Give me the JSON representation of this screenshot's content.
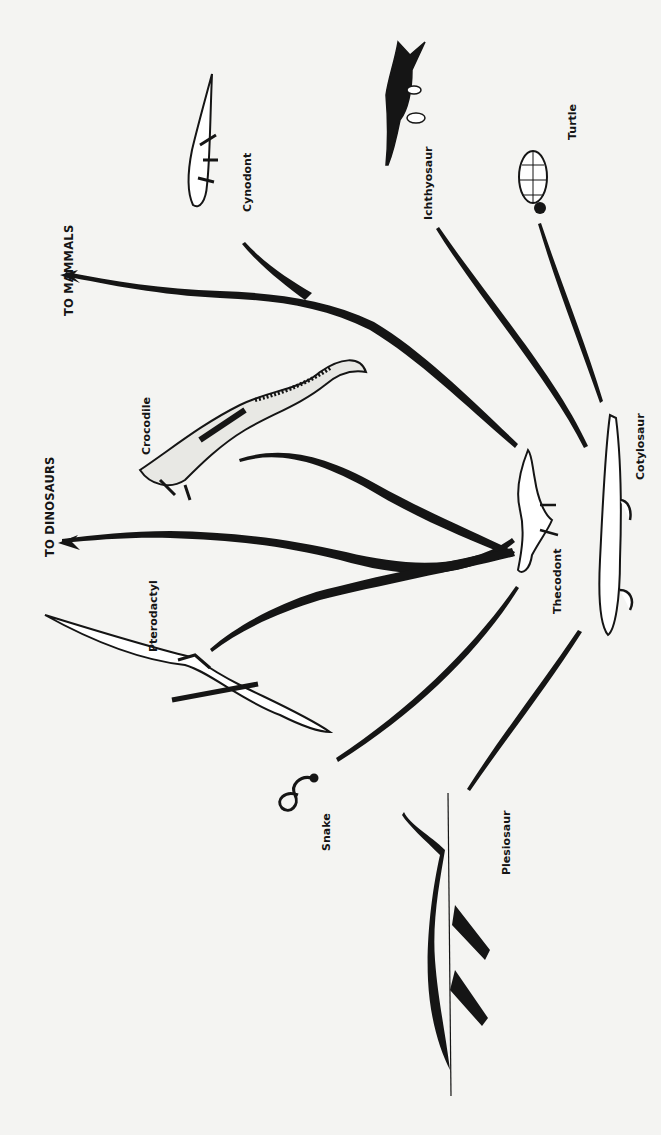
{
  "diagram": {
    "type": "evolutionary-tree",
    "orientation": "rotated-90-ccw",
    "colors": {
      "background": "#f4f4f2",
      "ink": "#151515"
    },
    "root": {
      "label": "Cotylosaur"
    },
    "nodes": [
      {
        "id": "cotylosaur",
        "label": "Cotylosaur"
      },
      {
        "id": "thecodont",
        "label": "Thecodont",
        "parent": "cotylosaur"
      },
      {
        "id": "turtle",
        "label": "Turtle",
        "parent": "cotylosaur"
      },
      {
        "id": "ichthyosaur",
        "label": "Ichthyosaur",
        "parent": "cotylosaur"
      },
      {
        "id": "cynodont",
        "label": "Cynodont",
        "parent": "cotylosaur"
      },
      {
        "id": "plesiosaur",
        "label": "Plesiosaur",
        "parent": "cotylosaur"
      },
      {
        "id": "snake",
        "label": "Snake",
        "parent": "cotylosaur"
      },
      {
        "id": "crocodile",
        "label": "Crocodile",
        "parent": "thecodont"
      },
      {
        "id": "pterodactyl",
        "label": "Pterodactyl",
        "parent": "thecodont"
      },
      {
        "id": "dinosaurs",
        "label": "TO DINOSAURS",
        "parent": "thecodont"
      },
      {
        "id": "mammals",
        "label": "TO MAMMALS",
        "parent": "cynodont"
      }
    ],
    "labels": {
      "to_mammals": "TO MAMMALS",
      "to_dinosaurs": "TO DINOSAURS",
      "cynodont": "Cynodont",
      "ichthyosaur": "Ichthyosaur",
      "turtle": "Turtle",
      "crocodile": "Crocodile",
      "pterodactyl": "Pterodactyl",
      "thecodont": "Thecodont",
      "cotylosaur": "Cotylosaur",
      "snake": "Snake",
      "plesiosaur": "Plesiosaur"
    }
  }
}
